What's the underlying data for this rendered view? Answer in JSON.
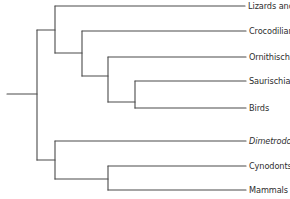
{
  "diagram": {
    "type": "cladogram",
    "colors": {
      "line": "#4a4a4a",
      "text": "#2e2e2e",
      "background": "#ffffff"
    },
    "taxa": [
      {
        "name": "Lizards and snakes",
        "y": 6,
        "italic": false
      },
      {
        "name": "Crocodilians",
        "y": 31,
        "italic": false
      },
      {
        "name": "Ornithischian dinosaurs",
        "y": 57,
        "italic": false
      },
      {
        "name": "Saurischian dinosaurs",
        "y": 81,
        "italic": false
      },
      {
        "name": "Birds",
        "y": 108,
        "italic": false
      },
      {
        "name": "Dimetrodon",
        "y": 141,
        "italic": true
      },
      {
        "name": "Cynodonts",
        "y": 166,
        "italic": false
      },
      {
        "name": "Mammals",
        "y": 190,
        "italic": false
      }
    ],
    "clades": [
      {
        "id": "root",
        "x": 37,
        "children": [
          "reptiles",
          "synapsids"
        ]
      },
      {
        "id": "reptiles",
        "x": 55,
        "children": [
          "Lizards and snakes",
          "archosaurs"
        ]
      },
      {
        "id": "archosaurs",
        "x": 82,
        "children": [
          "Crocodilians",
          "dinosaurs"
        ]
      },
      {
        "id": "dinosaurs",
        "x": 108,
        "children": [
          "Ornithischian dinosaurs",
          "saurischians"
        ]
      },
      {
        "id": "saurischians",
        "x": 135,
        "children": [
          "Saurischian dinosaurs",
          "Birds"
        ]
      },
      {
        "id": "synapsids",
        "x": 55,
        "children": [
          "Dimetrodon",
          "therapsids"
        ]
      },
      {
        "id": "therapsids",
        "x": 108,
        "children": [
          "Cynodonts",
          "Mammals"
        ]
      }
    ]
  },
  "labels": {
    "lizards": "Lizards and snakes",
    "crocodilians": "Crocodilians",
    "ornithischian": "Ornithischian dinosaurs",
    "saurischian": "Saurischian dinosaurs",
    "birds": "Birds",
    "dimetrodon": "Dimetrodon",
    "cynodonts": "Cynodonts",
    "mammals": "Mammals"
  }
}
